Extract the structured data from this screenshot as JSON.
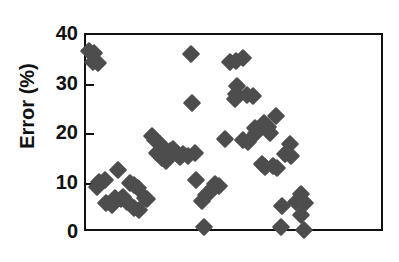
{
  "chart_data": {
    "type": "scatter",
    "title": "",
    "xlabel": "",
    "ylabel": "Error (%)",
    "ylim": [
      0,
      40
    ],
    "yticks": [
      0,
      10,
      20,
      30,
      40
    ],
    "ytick_labels": [
      "0",
      "10",
      "20",
      "30",
      "40"
    ],
    "xlim": [
      0,
      100
    ],
    "xticks": [],
    "xtick_labels": [],
    "grid": false,
    "legend": null,
    "marker": "diamond",
    "marker_color": "#4d4d4d",
    "axis_color": "#111111",
    "background": "#ffffff",
    "n_points": 73,
    "points": [
      {
        "x": 1.0,
        "y": 36.8
      },
      {
        "x": 2.6,
        "y": 36.3
      },
      {
        "x": 2.4,
        "y": 34.6
      },
      {
        "x": 4.0,
        "y": 34.3
      },
      {
        "x": 4.2,
        "y": 10.4
      },
      {
        "x": 3.6,
        "y": 9.3
      },
      {
        "x": 6.2,
        "y": 10.7
      },
      {
        "x": 6.6,
        "y": 6.1
      },
      {
        "x": 8.6,
        "y": 5.6
      },
      {
        "x": 9.8,
        "y": 7.0
      },
      {
        "x": 11.6,
        "y": 6.8
      },
      {
        "x": 12.4,
        "y": 7.3
      },
      {
        "x": 10.8,
        "y": 12.7
      },
      {
        "x": 13.8,
        "y": 6.2
      },
      {
        "x": 14.8,
        "y": 10.2
      },
      {
        "x": 16.2,
        "y": 9.6
      },
      {
        "x": 17.4,
        "y": 9.0
      },
      {
        "x": 16.0,
        "y": 5.1
      },
      {
        "x": 17.6,
        "y": 4.6
      },
      {
        "x": 19.6,
        "y": 7.1
      },
      {
        "x": 20.4,
        "y": 6.8
      },
      {
        "x": 22.0,
        "y": 19.6
      },
      {
        "x": 23.2,
        "y": 18.7
      },
      {
        "x": 24.6,
        "y": 18.0
      },
      {
        "x": 23.8,
        "y": 16.2
      },
      {
        "x": 25.4,
        "y": 15.2
      },
      {
        "x": 26.8,
        "y": 14.5
      },
      {
        "x": 28.0,
        "y": 16.6
      },
      {
        "x": 29.2,
        "y": 17.0
      },
      {
        "x": 30.4,
        "y": 16.0
      },
      {
        "x": 31.6,
        "y": 15.4
      },
      {
        "x": 32.6,
        "y": 16.0
      },
      {
        "x": 34.0,
        "y": 15.6
      },
      {
        "x": 36.6,
        "y": 16.1
      },
      {
        "x": 35.0,
        "y": 36.1
      },
      {
        "x": 35.6,
        "y": 26.2
      },
      {
        "x": 36.8,
        "y": 10.7
      },
      {
        "x": 38.8,
        "y": 6.4
      },
      {
        "x": 40.2,
        "y": 7.7
      },
      {
        "x": 41.4,
        "y": 8.3
      },
      {
        "x": 42.6,
        "y": 9.1
      },
      {
        "x": 43.0,
        "y": 10.0
      },
      {
        "x": 44.6,
        "y": 9.4
      },
      {
        "x": 39.6,
        "y": 1.3
      },
      {
        "x": 46.6,
        "y": 18.9
      },
      {
        "x": 48.2,
        "y": 34.6
      },
      {
        "x": 50.0,
        "y": 34.8
      },
      {
        "x": 52.4,
        "y": 35.3
      },
      {
        "x": 50.6,
        "y": 29.6
      },
      {
        "x": 50.0,
        "y": 28.1
      },
      {
        "x": 49.8,
        "y": 27.0
      },
      {
        "x": 54.0,
        "y": 27.9
      },
      {
        "x": 55.8,
        "y": 27.6
      },
      {
        "x": 52.6,
        "y": 18.8
      },
      {
        "x": 54.2,
        "y": 18.3
      },
      {
        "x": 56.4,
        "y": 21.2
      },
      {
        "x": 57.0,
        "y": 20.2
      },
      {
        "x": 59.6,
        "y": 22.3
      },
      {
        "x": 60.8,
        "y": 21.4
      },
      {
        "x": 61.4,
        "y": 20.2
      },
      {
        "x": 63.6,
        "y": 23.6
      },
      {
        "x": 58.8,
        "y": 13.9
      },
      {
        "x": 60.0,
        "y": 13.4
      },
      {
        "x": 62.4,
        "y": 13.5
      },
      {
        "x": 64.0,
        "y": 13.1
      },
      {
        "x": 66.6,
        "y": 16.0
      },
      {
        "x": 68.2,
        "y": 18.0
      },
      {
        "x": 68.6,
        "y": 15.5
      },
      {
        "x": 65.6,
        "y": 5.4
      },
      {
        "x": 65.2,
        "y": 1.3
      },
      {
        "x": 70.4,
        "y": 6.2
      },
      {
        "x": 71.8,
        "y": 7.9
      },
      {
        "x": 73.2,
        "y": 6.1
      },
      {
        "x": 72.0,
        "y": 3.6
      },
      {
        "x": 73.0,
        "y": 0.6
      }
    ]
  }
}
